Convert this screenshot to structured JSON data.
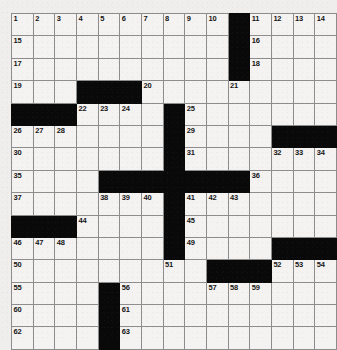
{
  "puzzle": {
    "title": "Crossword Grid",
    "rows": 15,
    "cols": 15,
    "colors": {
      "block": "#090909",
      "cell": "#f4f3f1",
      "grid_line": "#8d8d8d",
      "border": "#4a4a4a",
      "number_text": "#151515",
      "page_background": "#efeeec"
    },
    "grid": [
      [
        {
          "block": false,
          "num": "1"
        },
        {
          "block": false,
          "num": "2"
        },
        {
          "block": false,
          "num": "3"
        },
        {
          "block": false,
          "num": "4"
        },
        {
          "block": false,
          "num": "5"
        },
        {
          "block": false,
          "num": "6"
        },
        {
          "block": false,
          "num": "7"
        },
        {
          "block": false,
          "num": "8"
        },
        {
          "block": false,
          "num": "9"
        },
        {
          "block": false,
          "num": "10"
        },
        {
          "block": true,
          "num": ""
        },
        {
          "block": false,
          "num": "11"
        },
        {
          "block": false,
          "num": "12"
        },
        {
          "block": false,
          "num": "13"
        },
        {
          "block": false,
          "num": "14"
        }
      ],
      [
        {
          "block": false,
          "num": "15"
        },
        {
          "block": false,
          "num": ""
        },
        {
          "block": false,
          "num": ""
        },
        {
          "block": false,
          "num": ""
        },
        {
          "block": false,
          "num": ""
        },
        {
          "block": false,
          "num": ""
        },
        {
          "block": false,
          "num": ""
        },
        {
          "block": false,
          "num": ""
        },
        {
          "block": false,
          "num": ""
        },
        {
          "block": false,
          "num": ""
        },
        {
          "block": true,
          "num": ""
        },
        {
          "block": false,
          "num": "16"
        },
        {
          "block": false,
          "num": ""
        },
        {
          "block": false,
          "num": ""
        },
        {
          "block": false,
          "num": ""
        }
      ],
      [
        {
          "block": false,
          "num": "17"
        },
        {
          "block": false,
          "num": ""
        },
        {
          "block": false,
          "num": ""
        },
        {
          "block": false,
          "num": ""
        },
        {
          "block": false,
          "num": ""
        },
        {
          "block": false,
          "num": ""
        },
        {
          "block": false,
          "num": ""
        },
        {
          "block": false,
          "num": ""
        },
        {
          "block": false,
          "num": ""
        },
        {
          "block": false,
          "num": ""
        },
        {
          "block": true,
          "num": ""
        },
        {
          "block": false,
          "num": "18"
        },
        {
          "block": false,
          "num": ""
        },
        {
          "block": false,
          "num": ""
        },
        {
          "block": false,
          "num": ""
        }
      ],
      [
        {
          "block": false,
          "num": "19"
        },
        {
          "block": false,
          "num": ""
        },
        {
          "block": false,
          "num": ""
        },
        {
          "block": true,
          "num": ""
        },
        {
          "block": true,
          "num": ""
        },
        {
          "block": true,
          "num": ""
        },
        {
          "block": false,
          "num": "20"
        },
        {
          "block": false,
          "num": ""
        },
        {
          "block": false,
          "num": ""
        },
        {
          "block": false,
          "num": ""
        },
        {
          "block": false,
          "num": "21"
        },
        {
          "block": false,
          "num": ""
        },
        {
          "block": false,
          "num": ""
        },
        {
          "block": false,
          "num": ""
        },
        {
          "block": false,
          "num": ""
        }
      ],
      [
        {
          "block": true,
          "num": ""
        },
        {
          "block": true,
          "num": ""
        },
        {
          "block": true,
          "num": ""
        },
        {
          "block": false,
          "num": "22"
        },
        {
          "block": false,
          "num": "23"
        },
        {
          "block": false,
          "num": "24"
        },
        {
          "block": false,
          "num": ""
        },
        {
          "block": true,
          "num": ""
        },
        {
          "block": false,
          "num": "25"
        },
        {
          "block": false,
          "num": ""
        },
        {
          "block": false,
          "num": ""
        },
        {
          "block": false,
          "num": ""
        },
        {
          "block": false,
          "num": ""
        },
        {
          "block": false,
          "num": ""
        },
        {
          "block": false,
          "num": ""
        }
      ],
      [
        {
          "block": false,
          "num": "26"
        },
        {
          "block": false,
          "num": "27"
        },
        {
          "block": false,
          "num": "28"
        },
        {
          "block": false,
          "num": ""
        },
        {
          "block": false,
          "num": ""
        },
        {
          "block": false,
          "num": ""
        },
        {
          "block": false,
          "num": ""
        },
        {
          "block": true,
          "num": ""
        },
        {
          "block": false,
          "num": "29"
        },
        {
          "block": false,
          "num": ""
        },
        {
          "block": false,
          "num": ""
        },
        {
          "block": false,
          "num": ""
        },
        {
          "block": true,
          "num": ""
        },
        {
          "block": true,
          "num": ""
        },
        {
          "block": true,
          "num": ""
        }
      ],
      [
        {
          "block": false,
          "num": "30"
        },
        {
          "block": false,
          "num": ""
        },
        {
          "block": false,
          "num": ""
        },
        {
          "block": false,
          "num": ""
        },
        {
          "block": false,
          "num": ""
        },
        {
          "block": false,
          "num": ""
        },
        {
          "block": false,
          "num": ""
        },
        {
          "block": true,
          "num": ""
        },
        {
          "block": false,
          "num": "31"
        },
        {
          "block": false,
          "num": ""
        },
        {
          "block": false,
          "num": ""
        },
        {
          "block": false,
          "num": ""
        },
        {
          "block": false,
          "num": "32"
        },
        {
          "block": false,
          "num": "33"
        },
        {
          "block": false,
          "num": "34"
        }
      ],
      [
        {
          "block": false,
          "num": "35"
        },
        {
          "block": false,
          "num": ""
        },
        {
          "block": false,
          "num": ""
        },
        {
          "block": false,
          "num": ""
        },
        {
          "block": true,
          "num": ""
        },
        {
          "block": true,
          "num": ""
        },
        {
          "block": true,
          "num": ""
        },
        {
          "block": true,
          "num": ""
        },
        {
          "block": true,
          "num": ""
        },
        {
          "block": true,
          "num": ""
        },
        {
          "block": true,
          "num": ""
        },
        {
          "block": false,
          "num": "36"
        },
        {
          "block": false,
          "num": ""
        },
        {
          "block": false,
          "num": ""
        },
        {
          "block": false,
          "num": ""
        }
      ],
      [
        {
          "block": false,
          "num": "37"
        },
        {
          "block": false,
          "num": ""
        },
        {
          "block": false,
          "num": ""
        },
        {
          "block": false,
          "num": ""
        },
        {
          "block": false,
          "num": "38"
        },
        {
          "block": false,
          "num": "39"
        },
        {
          "block": false,
          "num": "40"
        },
        {
          "block": true,
          "num": ""
        },
        {
          "block": false,
          "num": "41"
        },
        {
          "block": false,
          "num": "42"
        },
        {
          "block": false,
          "num": "43"
        },
        {
          "block": false,
          "num": ""
        },
        {
          "block": false,
          "num": ""
        },
        {
          "block": false,
          "num": ""
        },
        {
          "block": false,
          "num": ""
        }
      ],
      [
        {
          "block": true,
          "num": ""
        },
        {
          "block": true,
          "num": ""
        },
        {
          "block": true,
          "num": ""
        },
        {
          "block": false,
          "num": "44"
        },
        {
          "block": false,
          "num": ""
        },
        {
          "block": false,
          "num": ""
        },
        {
          "block": false,
          "num": ""
        },
        {
          "block": true,
          "num": ""
        },
        {
          "block": false,
          "num": "45"
        },
        {
          "block": false,
          "num": ""
        },
        {
          "block": false,
          "num": ""
        },
        {
          "block": false,
          "num": ""
        },
        {
          "block": false,
          "num": ""
        },
        {
          "block": false,
          "num": ""
        },
        {
          "block": false,
          "num": ""
        }
      ],
      [
        {
          "block": false,
          "num": "46"
        },
        {
          "block": false,
          "num": "47"
        },
        {
          "block": false,
          "num": "48"
        },
        {
          "block": false,
          "num": ""
        },
        {
          "block": false,
          "num": ""
        },
        {
          "block": false,
          "num": ""
        },
        {
          "block": false,
          "num": ""
        },
        {
          "block": true,
          "num": ""
        },
        {
          "block": false,
          "num": "49"
        },
        {
          "block": false,
          "num": ""
        },
        {
          "block": false,
          "num": ""
        },
        {
          "block": false,
          "num": ""
        },
        {
          "block": true,
          "num": ""
        },
        {
          "block": true,
          "num": ""
        },
        {
          "block": true,
          "num": ""
        }
      ],
      [
        {
          "block": false,
          "num": "50"
        },
        {
          "block": false,
          "num": ""
        },
        {
          "block": false,
          "num": ""
        },
        {
          "block": false,
          "num": ""
        },
        {
          "block": false,
          "num": ""
        },
        {
          "block": false,
          "num": ""
        },
        {
          "block": false,
          "num": ""
        },
        {
          "block": false,
          "num": "51"
        },
        {
          "block": false,
          "num": ""
        },
        {
          "block": true,
          "num": ""
        },
        {
          "block": true,
          "num": ""
        },
        {
          "block": true,
          "num": ""
        },
        {
          "block": false,
          "num": "52"
        },
        {
          "block": false,
          "num": "53"
        },
        {
          "block": false,
          "num": "54"
        }
      ],
      [
        {
          "block": false,
          "num": "55"
        },
        {
          "block": false,
          "num": ""
        },
        {
          "block": false,
          "num": ""
        },
        {
          "block": false,
          "num": ""
        },
        {
          "block": true,
          "num": ""
        },
        {
          "block": false,
          "num": "56"
        },
        {
          "block": false,
          "num": ""
        },
        {
          "block": false,
          "num": ""
        },
        {
          "block": false,
          "num": ""
        },
        {
          "block": false,
          "num": "57"
        },
        {
          "block": false,
          "num": "58"
        },
        {
          "block": false,
          "num": "59"
        },
        {
          "block": false,
          "num": ""
        },
        {
          "block": false,
          "num": ""
        },
        {
          "block": false,
          "num": ""
        }
      ],
      [
        {
          "block": false,
          "num": "60"
        },
        {
          "block": false,
          "num": ""
        },
        {
          "block": false,
          "num": ""
        },
        {
          "block": false,
          "num": ""
        },
        {
          "block": true,
          "num": ""
        },
        {
          "block": false,
          "num": "61"
        },
        {
          "block": false,
          "num": ""
        },
        {
          "block": false,
          "num": ""
        },
        {
          "block": false,
          "num": ""
        },
        {
          "block": false,
          "num": ""
        },
        {
          "block": false,
          "num": ""
        },
        {
          "block": false,
          "num": ""
        },
        {
          "block": false,
          "num": ""
        },
        {
          "block": false,
          "num": ""
        },
        {
          "block": false,
          "num": ""
        }
      ],
      [
        {
          "block": false,
          "num": "62"
        },
        {
          "block": false,
          "num": ""
        },
        {
          "block": false,
          "num": ""
        },
        {
          "block": false,
          "num": ""
        },
        {
          "block": true,
          "num": ""
        },
        {
          "block": false,
          "num": "63"
        },
        {
          "block": false,
          "num": ""
        },
        {
          "block": false,
          "num": ""
        },
        {
          "block": false,
          "num": ""
        },
        {
          "block": false,
          "num": ""
        },
        {
          "block": false,
          "num": ""
        },
        {
          "block": false,
          "num": ""
        },
        {
          "block": false,
          "num": ""
        },
        {
          "block": false,
          "num": ""
        },
        {
          "block": false,
          "num": ""
        }
      ]
    ]
  }
}
